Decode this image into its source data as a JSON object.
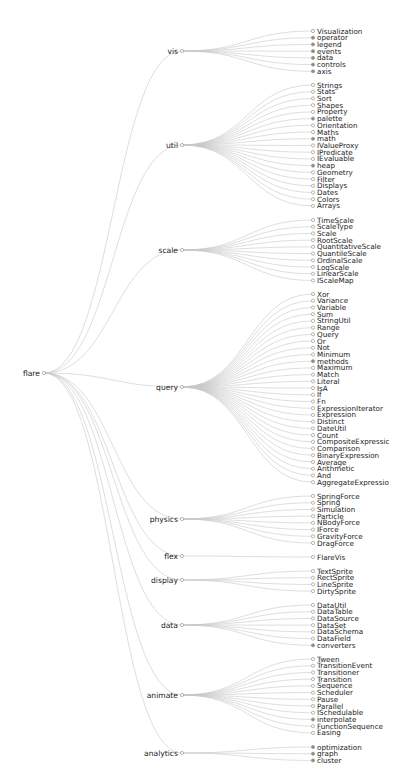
{
  "diagram": {
    "type": "dendrogram",
    "root": {
      "name": "flare",
      "x": 44,
      "y": 373
    },
    "layout": {
      "mid_x": 182,
      "leaf_x": 313,
      "leaf_step": 6.72
    },
    "groups": [
      {
        "name": "vis",
        "y": 51,
        "first_leaf_y": 31,
        "children": [
          {
            "name": "Visualization",
            "branch": false
          },
          {
            "name": "operator",
            "branch": true
          },
          {
            "name": "legend",
            "branch": true
          },
          {
            "name": "events",
            "branch": true
          },
          {
            "name": "data",
            "branch": true
          },
          {
            "name": "controls",
            "branch": true
          },
          {
            "name": "axis",
            "branch": true
          }
        ]
      },
      {
        "name": "util",
        "y": 145,
        "first_leaf_y": 85,
        "children": [
          {
            "name": "Strings",
            "branch": false
          },
          {
            "name": "Stats",
            "branch": false
          },
          {
            "name": "Sort",
            "branch": false
          },
          {
            "name": "Shapes",
            "branch": false
          },
          {
            "name": "Property",
            "branch": false
          },
          {
            "name": "palette",
            "branch": true
          },
          {
            "name": "Orientation",
            "branch": false
          },
          {
            "name": "Maths",
            "branch": false
          },
          {
            "name": "math",
            "branch": true
          },
          {
            "name": "IValueProxy",
            "branch": false
          },
          {
            "name": "IPredicate",
            "branch": false
          },
          {
            "name": "IEvaluable",
            "branch": false
          },
          {
            "name": "heap",
            "branch": true
          },
          {
            "name": "Geometry",
            "branch": false
          },
          {
            "name": "Filter",
            "branch": false
          },
          {
            "name": "Displays",
            "branch": false
          },
          {
            "name": "Dates",
            "branch": false
          },
          {
            "name": "Colors",
            "branch": false
          },
          {
            "name": "Arrays",
            "branch": false
          }
        ]
      },
      {
        "name": "scale",
        "y": 250,
        "first_leaf_y": 220,
        "children": [
          {
            "name": "TimeScale",
            "branch": false
          },
          {
            "name": "ScaleType",
            "branch": false
          },
          {
            "name": "Scale",
            "branch": false
          },
          {
            "name": "RootScale",
            "branch": false
          },
          {
            "name": "QuantitativeScale",
            "branch": false
          },
          {
            "name": "QuantileScale",
            "branch": false
          },
          {
            "name": "OrdinalScale",
            "branch": false
          },
          {
            "name": "LogScale",
            "branch": false
          },
          {
            "name": "LinearScale",
            "branch": false
          },
          {
            "name": "IScaleMap",
            "branch": false
          }
        ]
      },
      {
        "name": "query",
        "y": 387,
        "first_leaf_y": 294,
        "children": [
          {
            "name": "Xor",
            "branch": false
          },
          {
            "name": "Variance",
            "branch": false
          },
          {
            "name": "Variable",
            "branch": false
          },
          {
            "name": "Sum",
            "branch": false
          },
          {
            "name": "StringUtil",
            "branch": false
          },
          {
            "name": "Range",
            "branch": false
          },
          {
            "name": "Query",
            "branch": false
          },
          {
            "name": "Or",
            "branch": false
          },
          {
            "name": "Not",
            "branch": false
          },
          {
            "name": "Minimum",
            "branch": false
          },
          {
            "name": "methods",
            "branch": true
          },
          {
            "name": "Maximum",
            "branch": false
          },
          {
            "name": "Match",
            "branch": false
          },
          {
            "name": "Literal",
            "branch": false
          },
          {
            "name": "IsA",
            "branch": false
          },
          {
            "name": "If",
            "branch": false
          },
          {
            "name": "Fn",
            "branch": false
          },
          {
            "name": "ExpressionIterator",
            "branch": false
          },
          {
            "name": "Expression",
            "branch": false
          },
          {
            "name": "Distinct",
            "branch": false
          },
          {
            "name": "DateUtil",
            "branch": false
          },
          {
            "name": "Count",
            "branch": false
          },
          {
            "name": "CompositeExpressic",
            "branch": false
          },
          {
            "name": "Comparison",
            "branch": false
          },
          {
            "name": "BinaryExpression",
            "branch": false
          },
          {
            "name": "Average",
            "branch": false
          },
          {
            "name": "Arithmetic",
            "branch": false
          },
          {
            "name": "And",
            "branch": false
          },
          {
            "name": "AggregateExpressio",
            "branch": false
          }
        ]
      },
      {
        "name": "physics",
        "y": 519,
        "first_leaf_y": 496,
        "children": [
          {
            "name": "SpringForce",
            "branch": false
          },
          {
            "name": "Spring",
            "branch": false
          },
          {
            "name": "Simulation",
            "branch": false
          },
          {
            "name": "Particle",
            "branch": false
          },
          {
            "name": "NBodyForce",
            "branch": false
          },
          {
            "name": "IForce",
            "branch": false
          },
          {
            "name": "GravityForce",
            "branch": false
          },
          {
            "name": "DragForce",
            "branch": false
          }
        ]
      },
      {
        "name": "flex",
        "y": 556,
        "first_leaf_y": 557,
        "children": [
          {
            "name": "FlareVis",
            "branch": false
          }
        ]
      },
      {
        "name": "display",
        "y": 580,
        "first_leaf_y": 571,
        "children": [
          {
            "name": "TextSprite",
            "branch": false
          },
          {
            "name": "RectSprite",
            "branch": false
          },
          {
            "name": "LineSprite",
            "branch": false
          },
          {
            "name": "DirtySprite",
            "branch": false
          }
        ]
      },
      {
        "name": "data",
        "y": 625,
        "first_leaf_y": 605,
        "children": [
          {
            "name": "DataUtil",
            "branch": false
          },
          {
            "name": "DataTable",
            "branch": false
          },
          {
            "name": "DataSource",
            "branch": false
          },
          {
            "name": "DataSet",
            "branch": false
          },
          {
            "name": "DataSchema",
            "branch": false
          },
          {
            "name": "DataField",
            "branch": false
          },
          {
            "name": "converters",
            "branch": true
          }
        ]
      },
      {
        "name": "animate",
        "y": 695,
        "first_leaf_y": 659,
        "children": [
          {
            "name": "Tween",
            "branch": false
          },
          {
            "name": "TransitionEvent",
            "branch": false
          },
          {
            "name": "Transitioner",
            "branch": false
          },
          {
            "name": "Transition",
            "branch": false
          },
          {
            "name": "Sequence",
            "branch": false
          },
          {
            "name": "Scheduler",
            "branch": false
          },
          {
            "name": "Pause",
            "branch": false
          },
          {
            "name": "Parallel",
            "branch": false
          },
          {
            "name": "ISchedulable",
            "branch": false
          },
          {
            "name": "interpolate",
            "branch": true
          },
          {
            "name": "FunctionSequence",
            "branch": false
          },
          {
            "name": "Easing",
            "branch": false
          }
        ]
      },
      {
        "name": "analytics",
        "y": 753,
        "first_leaf_y": 747,
        "children": [
          {
            "name": "optimization",
            "branch": true
          },
          {
            "name": "graph",
            "branch": true
          },
          {
            "name": "cluster",
            "branch": true
          }
        ]
      }
    ],
    "colors": {
      "link": "#c8c8c8",
      "node_stroke": "#9a9a9a",
      "branch_fill": "#8a8a8a",
      "text": "#222222"
    }
  },
  "caption": {
    "text": ""
  }
}
